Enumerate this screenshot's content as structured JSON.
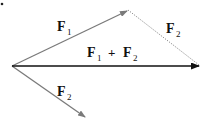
{
  "diagram": {
    "vectors": [
      {
        "id": "F1",
        "label": "F",
        "subscript": "1",
        "from": [
          12,
          66
        ],
        "to": [
          128,
          10
        ],
        "color": "#7a7a7a",
        "style": "solid"
      },
      {
        "id": "F2",
        "label": "F",
        "subscript": "2",
        "from": [
          12,
          66
        ],
        "to": [
          86,
          118
        ],
        "color": "#7a7a7a",
        "style": "solid"
      },
      {
        "id": "F2-translated",
        "label": "F",
        "subscript": "2",
        "from": [
          128,
          10
        ],
        "to": [
          200,
          66
        ],
        "color": "#7a7a7a",
        "style": "dotted"
      },
      {
        "id": "resultant",
        "label": "F1 + F2",
        "from": [
          12,
          66
        ],
        "to": [
          200,
          66
        ],
        "color": "#111111",
        "style": "solid"
      }
    ],
    "labels": {
      "f1": {
        "main": "F",
        "sub": "1"
      },
      "f2_top": {
        "main": "F",
        "sub": "2"
      },
      "f2_bottom": {
        "main": "F",
        "sub": "2"
      },
      "sum_a": {
        "main": "F",
        "sub": "1"
      },
      "plus": "+",
      "sum_b": {
        "main": "F",
        "sub": "2"
      }
    }
  }
}
